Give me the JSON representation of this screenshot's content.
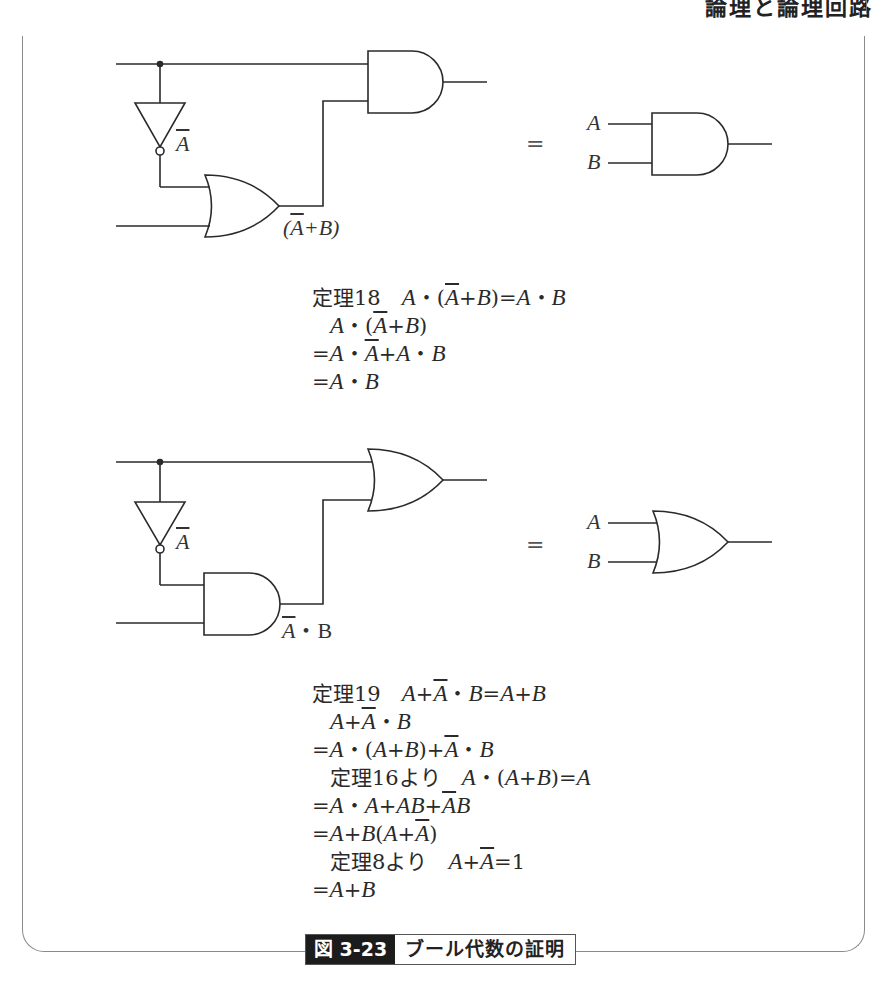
{
  "header": {
    "running_title": "論理と論理回路"
  },
  "figure": {
    "number": "図 3-23",
    "title": "ブール代数の証明"
  },
  "circuit1": {
    "inverter_label": "A",
    "or_output_label_open": "(",
    "or_output_label_a": "A",
    "or_output_label_rest": "+B)",
    "equals": "=",
    "equiv_gate": "AND",
    "equiv_input_a": "A",
    "equiv_input_b": "B"
  },
  "circuit2": {
    "inverter_label": "A",
    "and_output_label_a": "A",
    "and_output_label_rest": "・B",
    "equals": "=",
    "equiv_gate": "OR",
    "equiv_input_a": "A",
    "equiv_input_b": "B"
  },
  "proof18": {
    "lines": [
      "定理18　A・(Ā+B)=A・B",
      "A・(Ā+B)",
      "=A・Ā+A・B",
      "=A・B"
    ]
  },
  "proof19": {
    "lines": [
      "定理19　A+Ā・B=A+B",
      "A+Ā・B",
      "=A・(A+B)+Ā・B",
      "定理16より　A・(A+B)=A",
      "=A・A+AB+ĀB",
      "=A+B(A+Ā)",
      "定理8より　A+Ā=1",
      "=A+B"
    ]
  }
}
